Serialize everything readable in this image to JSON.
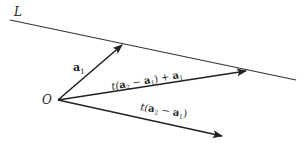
{
  "diagram": {
    "line_label": "L",
    "origin_label": "O",
    "vectors": [
      {
        "name": "a1",
        "label_bold": "a",
        "label_sub": "1"
      },
      {
        "name": "t(a2-a1)+a1",
        "label_pre": "t(",
        "label_a2": "a",
        "label_a2_sub": "2",
        "label_minus": " − ",
        "label_a1": "a",
        "label_a1_sub": "1",
        "label_post": ") + ",
        "label_a1b": "a",
        "label_a1b_sub": "1"
      },
      {
        "name": "t(a2-a1)",
        "label_pre": "t(",
        "label_a2": "a",
        "label_a2_sub": "2",
        "label_minus": " − ",
        "label_a1": "a",
        "label_a1_sub": "1",
        "label_post": ")"
      }
    ],
    "colors": {
      "stroke": "#222222",
      "background": "#ffffff"
    }
  }
}
